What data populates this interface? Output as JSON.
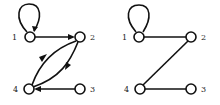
{
  "figure": {
    "left_graph": {
      "type": "directed",
      "nodes": [
        {
          "id": "1",
          "label": "1",
          "x": 30,
          "y": 37
        },
        {
          "id": "2",
          "label": "2",
          "x": 80,
          "y": 37
        },
        {
          "id": "3",
          "label": "3",
          "x": 80,
          "y": 89
        },
        {
          "id": "4",
          "label": "4",
          "x": 29,
          "y": 89
        }
      ],
      "edges": [
        {
          "from": "1",
          "to": "1",
          "kind": "self-loop"
        },
        {
          "from": "1",
          "to": "2"
        },
        {
          "from": "2",
          "to": "4",
          "kind": "curved"
        },
        {
          "from": "4",
          "to": "2",
          "kind": "curved"
        },
        {
          "from": "3",
          "to": "4"
        }
      ]
    },
    "right_graph": {
      "type": "undirected",
      "nodes": [
        {
          "id": "1",
          "label": "1",
          "x": 139,
          "y": 37
        },
        {
          "id": "2",
          "label": "2",
          "x": 191,
          "y": 37
        },
        {
          "id": "3",
          "label": "3",
          "x": 191,
          "y": 89
        },
        {
          "id": "4",
          "label": "4",
          "x": 140,
          "y": 89
        }
      ],
      "edges": [
        {
          "from": "1",
          "to": "1",
          "kind": "self-loop"
        },
        {
          "from": "1",
          "to": "2"
        },
        {
          "from": "2",
          "to": "4"
        },
        {
          "from": "4",
          "to": "3"
        }
      ]
    }
  }
}
